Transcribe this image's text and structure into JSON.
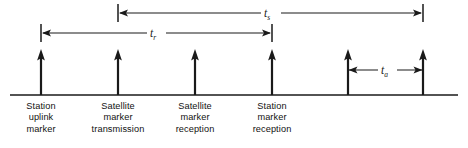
{
  "figure": {
    "background_color": "#ffffff",
    "ink_color": "#1a1a1a",
    "width": 468,
    "height": 148
  },
  "baseline": {
    "name": "time-axis",
    "y": 95,
    "x_start": 10,
    "x_end": 458
  },
  "markers": [
    {
      "id": "station-uplink-marker",
      "x": 41,
      "tip_y": 50,
      "label_lines": [
        "Station",
        "uplink",
        "marker"
      ]
    },
    {
      "id": "satellite-marker-transmission",
      "x": 118,
      "tip_y": 50,
      "label_lines": [
        "Satellite",
        "marker",
        "transmission"
      ]
    },
    {
      "id": "satellite-marker-reception",
      "x": 195,
      "tip_y": 50,
      "label_lines": [
        "Satellite",
        "marker",
        "reception"
      ]
    },
    {
      "id": "station-marker-reception",
      "x": 272,
      "tip_y": 50,
      "label_lines": [
        "Station",
        "marker",
        "reception"
      ]
    },
    {
      "id": "unlabeled-marker-5",
      "x": 348,
      "tip_y": 50,
      "label_lines": []
    },
    {
      "id": "unlabeled-marker-6",
      "x": 423,
      "tip_y": 50,
      "label_lines": []
    }
  ],
  "intervals": [
    {
      "id": "interval-ts",
      "symbol": "t",
      "subscript": "s",
      "y": 13,
      "x_start": 118,
      "x_end": 423,
      "label_x": 270,
      "tick_start": true,
      "tick_end": true,
      "tick_half_height": 9
    },
    {
      "id": "interval-tr",
      "symbol": "t",
      "subscript": "r",
      "y": 33,
      "x_start": 41,
      "x_end": 272,
      "label_x": 155,
      "tick_start": true,
      "tick_end": true,
      "tick_half_height": 9
    },
    {
      "id": "interval-ta",
      "symbol": "t",
      "subscript": "a",
      "y": 70,
      "x_start": 348,
      "x_end": 423,
      "label_x": 386,
      "tick_start": false,
      "tick_end": false,
      "tick_half_height": 0
    }
  ]
}
